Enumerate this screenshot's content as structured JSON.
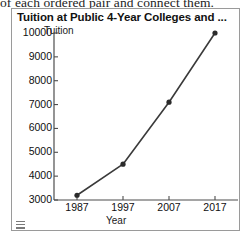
{
  "worksheet": {
    "instruction_text": "of each ordered pair and connect them."
  },
  "panel": {
    "title": "Tuition at Public 4-Year Colleges and ...",
    "grip_icon": "resize-grip-icon"
  },
  "chart_data": {
    "type": "line",
    "title": "Tuition at Public 4-Year Colleges and ...",
    "xlabel": "Year",
    "ylabel": "Tuition",
    "x": [
      1987,
      1997,
      2007,
      2017
    ],
    "values": [
      3200,
      4500,
      7100,
      10000
    ],
    "categories": [
      "1987",
      "1997",
      "2007",
      "2017"
    ],
    "xtick_labels": [
      "1987",
      "1997",
      "2007",
      "2017"
    ],
    "ytick_labels": [
      "10000",
      "9000",
      "8000",
      "7000",
      "6000",
      "5000",
      "4000",
      "3000"
    ],
    "ytick_values": [
      10000,
      9000,
      8000,
      7000,
      6000,
      5000,
      4000,
      3000
    ],
    "ylim": [
      3000,
      10000
    ],
    "xlim": [
      1982,
      2022
    ],
    "grid": false,
    "legend": "none",
    "marker": "circle",
    "line_color": "#3a3a3a",
    "marker_color": "#2b2b2b",
    "axis_color": "#4d4d4d",
    "background_color": "#ffffff"
  }
}
